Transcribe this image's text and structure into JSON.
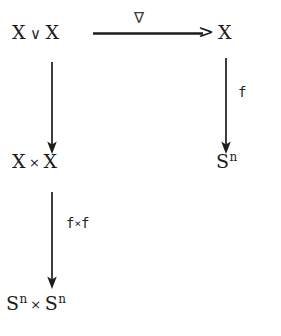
{
  "diagram": {
    "background_color": "#ffffff",
    "ink_color": "#1c1c1c",
    "nodes": [
      {
        "id": "xvx",
        "base_left": "X",
        "operator": "∨",
        "base_right": "X",
        "text": "X ∨ X"
      },
      {
        "id": "x-target",
        "base_left": "X",
        "operator": "",
        "base_right": "",
        "text": "X"
      },
      {
        "id": "xxx",
        "base_left": "X",
        "operator": "×",
        "base_right": "X",
        "text": "X × X"
      },
      {
        "id": "sn-right",
        "base_left": "S",
        "superscript": "n",
        "text": "Sⁿ"
      },
      {
        "id": "snxsn",
        "base_left": "S",
        "superscript": "n",
        "operator": "×",
        "base_right": "S",
        "superscript_right": "n",
        "text": "Sⁿ × Sⁿ"
      }
    ],
    "node_labels": {
      "top_left_base_1": "X",
      "top_left_vee": "∨",
      "top_left_base_2": "X",
      "top_right": "X",
      "mid_left_base_1": "X",
      "mid_left_times": "×",
      "mid_left_base_2": "X",
      "mid_right_base": "S",
      "mid_right_sup": "n",
      "bottom_base_1": "S",
      "bottom_sup_1": "n",
      "bottom_times": "×",
      "bottom_base_2": "S",
      "bottom_sup_2": "n"
    },
    "edges": [
      {
        "id": "top-horizontal",
        "from": "X ∨ X",
        "to": "X",
        "label": "∇",
        "direction": "right",
        "arrowhead": ">"
      },
      {
        "id": "left-vertical-1",
        "from": "X ∨ X",
        "to": "X × X",
        "label": "",
        "direction": "down"
      },
      {
        "id": "right-vertical",
        "from": "X",
        "to": "Sⁿ",
        "label": "f",
        "direction": "down"
      },
      {
        "id": "left-vertical-2",
        "from": "X × X",
        "to": "Sⁿ × Sⁿ",
        "label": "f×f",
        "direction": "down"
      }
    ],
    "edge_labels": {
      "nabla": "∇",
      "f": "f",
      "fxf_left": "f",
      "fxf_times": "×",
      "fxf_right": "f",
      "arrowhead_gt": ">"
    }
  }
}
